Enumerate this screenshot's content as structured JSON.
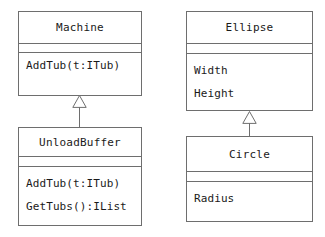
{
  "diagram": {
    "type": "uml-class-diagram",
    "background_color": "#ffffff",
    "line_color": "#6e6e6e",
    "text_color": "#1a1a1a"
  },
  "classes": [
    {
      "id": "machine",
      "name": "Machine",
      "attributes": [],
      "operations": [
        "AddTub(t:ITub)"
      ]
    },
    {
      "id": "unloadbuffer",
      "name": "UnloadBuffer",
      "attributes": [],
      "operations": [
        "AddTub(t:ITub)",
        "GetTubs():IList"
      ]
    },
    {
      "id": "ellipse",
      "name": "Ellipse",
      "attributes": [
        "Width",
        "Height"
      ],
      "operations": []
    },
    {
      "id": "circle",
      "name": "Circle",
      "attributes": [
        "Radius"
      ],
      "operations": []
    }
  ],
  "relationships": [
    {
      "kind": "generalization",
      "label": "",
      "subclass": "UnloadBuffer",
      "superclass": "Machine"
    },
    {
      "kind": "generalization",
      "label": "",
      "subclass": "Circle",
      "superclass": "Ellipse"
    }
  ]
}
